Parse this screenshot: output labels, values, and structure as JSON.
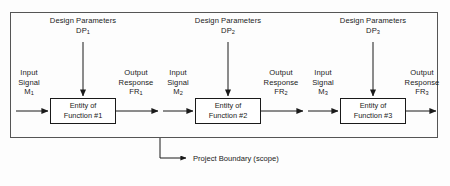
{
  "diagram": {
    "boundary": {
      "label": "Project Boundary (scope)",
      "name": "project-boundary-box"
    },
    "colors": {
      "line": "#1a1a1a",
      "box_fill": "#ffffff",
      "boundary_stroke": "#555555",
      "background": "#fdfdfd",
      "text": "#1a1a1a"
    },
    "stages": [
      {
        "index": "1",
        "design_parameters_line1": "Design Parameters",
        "design_parameters_symbol": "DP",
        "design_parameters_sub": "1",
        "input_line1": "Input",
        "input_line2": "Signal",
        "input_symbol": "M",
        "input_sub": "1",
        "entity_line1": "Entity of",
        "entity_line2": "Function #1",
        "output_line1": "Output",
        "output_line2": "Response",
        "output_symbol": "FR",
        "output_sub": "1"
      },
      {
        "index": "2",
        "design_parameters_line1": "Design Parameters",
        "design_parameters_symbol": "DP",
        "design_parameters_sub": "2",
        "input_line1": "Input",
        "input_line2": "Signal",
        "input_symbol": "M",
        "input_sub": "2",
        "entity_line1": "Entity of",
        "entity_line2": "Function #2",
        "output_line1": "Output",
        "output_line2": "Response",
        "output_symbol": "FR",
        "output_sub": "2"
      },
      {
        "index": "3",
        "design_parameters_line1": "Design Parameters",
        "design_parameters_symbol": "DP",
        "design_parameters_sub": "3",
        "input_line1": "Input",
        "input_line2": "Signal",
        "input_symbol": "M",
        "input_sub": "3",
        "entity_line1": "Entity of",
        "entity_line2": "Function #3",
        "output_line1": "Output",
        "output_line2": "Response",
        "output_symbol": "FR",
        "output_sub": "3"
      }
    ]
  }
}
